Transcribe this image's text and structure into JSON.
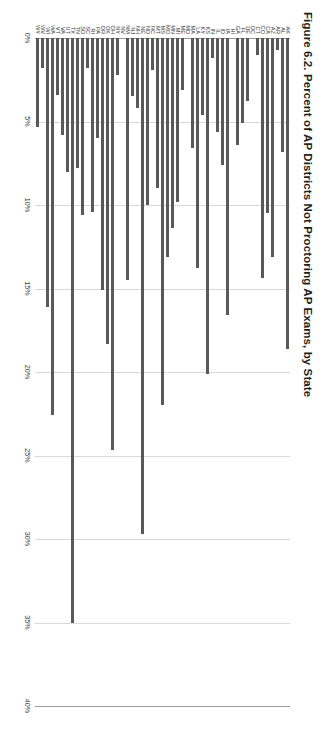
{
  "figure": {
    "title": "Figure 6.2. Percent of AP Districts Not Proctoring AP Exams, by State"
  },
  "axis": {
    "tick_labels": [
      "0%",
      "5%",
      "10%",
      "15%",
      "20%",
      "25%",
      "30%",
      "35%",
      "40%"
    ]
  },
  "chart_data": {
    "type": "bar",
    "orientation": "horizontal",
    "title": "Figure 6.2. Percent of AP Districts Not Proctoring AP Exams, by State",
    "xlabel": "",
    "ylabel": "",
    "xlim": [
      0,
      40
    ],
    "xtick_labels": [
      "0%",
      "5%",
      "10%",
      "15%",
      "20%",
      "25%",
      "30%",
      "35%",
      "40%"
    ],
    "xticks": [
      0,
      5,
      10,
      15,
      20,
      25,
      30,
      35,
      40
    ],
    "grid": true,
    "legend": false,
    "units": "percent",
    "categories": [
      "AK",
      "AL",
      "AR",
      "AZ",
      "CA",
      "CO",
      "CT",
      "DC",
      "DE",
      "FL",
      "GA",
      "HI",
      "IA",
      "ID",
      "IL",
      "IN",
      "KS",
      "KY",
      "LA",
      "MA",
      "MD",
      "ME",
      "MI",
      "MN",
      "MO",
      "MS",
      "MT",
      "NC",
      "ND",
      "NE",
      "NH",
      "NJ",
      "NM",
      "NV",
      "NY",
      "OH",
      "OK",
      "OR",
      "PA",
      "RI",
      "SC",
      "SD",
      "TN",
      "TX",
      "UT",
      "VA",
      "VT",
      "WA",
      "WI",
      "WV",
      "WY"
    ],
    "values": [
      18.6,
      6.8,
      0.7,
      13.1,
      10.5,
      14.4,
      1.0,
      0.0,
      3.8,
      5.1,
      6.4,
      0.0,
      16.6,
      7.6,
      5.6,
      1.2,
      20.1,
      4.6,
      13.8,
      6.6,
      0.0,
      3.1,
      9.8,
      11.4,
      13.1,
      22.0,
      9.0,
      1.9,
      10.0,
      29.7,
      4.2,
      3.5,
      14.5,
      0.0,
      2.2,
      24.7,
      18.3,
      15.1,
      6.0,
      10.4,
      1.8,
      10.6,
      7.8,
      35.0,
      8.0,
      5.8,
      3.4,
      22.6,
      16.1,
      1.8,
      5.3
    ]
  },
  "colors": {
    "bar": "#595959",
    "gridline": "#d9d9d9",
    "axis": "#9a9a9a",
    "text": "#3c3c3c",
    "title_text": "#231f20",
    "background": "#ffffff"
  }
}
